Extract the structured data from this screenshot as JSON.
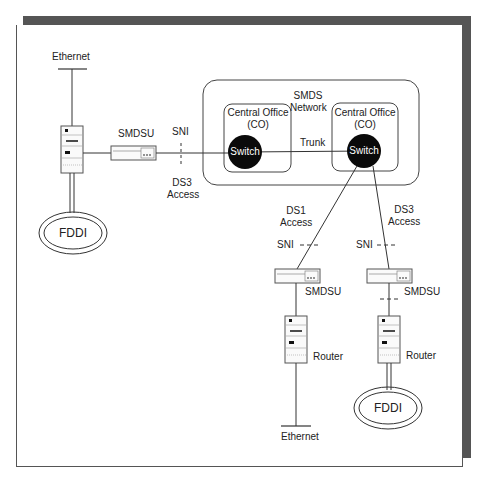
{
  "diagram": {
    "network": {
      "title_line1": "SMDS",
      "title_line2": "Network"
    },
    "central_office_left": {
      "line1": "Central Office",
      "line2": "(CO)",
      "switch": "Switch"
    },
    "central_office_right": {
      "line1": "Central Office",
      "line2": "(CO)",
      "switch": "Switch"
    },
    "trunk": "Trunk",
    "left_site": {
      "ethernet": "Ethernet",
      "smdsu": "SMDSU",
      "sni": "SNI",
      "access_line1": "DS3",
      "access_line2": "Access",
      "fddi": "FDDI"
    },
    "middle_site": {
      "access_line1": "DS1",
      "access_line2": "Access",
      "sni": "SNI",
      "smdsu": "SMDSU",
      "router": "Router",
      "ethernet": "Ethernet"
    },
    "right_site": {
      "access_line1": "DS3",
      "access_line2": "Access",
      "sni": "SNI",
      "smdsu": "SMDSU",
      "router": "Router",
      "fddi": "FDDI"
    }
  }
}
